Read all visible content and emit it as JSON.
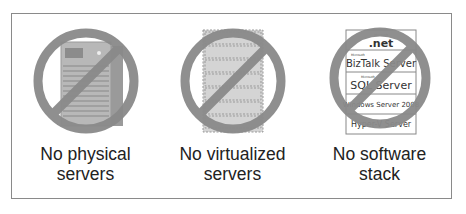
{
  "panels": [
    {
      "id": "physical",
      "graphic": "physical-server-icon",
      "caption_line1": "No physical",
      "caption_line2": "servers"
    },
    {
      "id": "virtualized",
      "graphic": "virtualized-server-icon",
      "caption_line1": "No virtualized",
      "caption_line2": "servers"
    },
    {
      "id": "software",
      "graphic": "software-stack-icon",
      "caption_line1": "No software",
      "caption_line2": "stack",
      "stack_labels": [
        {
          "brand": "Microsoft",
          "name": ".net"
        },
        {
          "brand": "Microsoft",
          "name": "BizTalk Server"
        },
        {
          "brand": "Microsoft",
          "name": "SQL Server"
        },
        {
          "brand": "",
          "name": "Windows Server 2008"
        },
        {
          "brand": "",
          "name": "Hyper-V Server"
        }
      ]
    }
  ],
  "colors": {
    "prohibition": "#8a8a8a",
    "frame": "#8a8a8a",
    "text": "#222222"
  }
}
